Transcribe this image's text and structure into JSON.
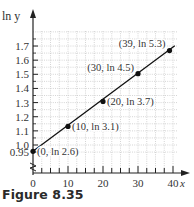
{
  "caption": "Figure 8.35",
  "chart_data": {
    "type": "line",
    "title": "",
    "xlabel": "x",
    "ylabel": "ln y",
    "xlim": [
      0,
      40
    ],
    "ylim": [
      0.95,
      1.8
    ],
    "y_axis_break": true,
    "grid": true,
    "x_ticks": [
      "0",
      "10",
      "20",
      "30",
      "40"
    ],
    "y_ticks": [
      "0.95",
      "1.0",
      "1.1",
      "1.2",
      "1.3",
      "1.4",
      "1.5",
      "1.6",
      "1.7"
    ],
    "series": [
      {
        "name": "ln y vs x",
        "x": [
          0,
          10,
          20,
          30,
          39
        ],
        "y": [
          0.9555,
          1.1314,
          1.3083,
          1.5041,
          1.6677
        ]
      }
    ],
    "annotations": [
      {
        "x": 0,
        "y": 0.9555,
        "label": "(0, ln 2.6)"
      },
      {
        "x": 10,
        "y": 1.1314,
        "label": "(10, ln 3.1)"
      },
      {
        "x": 20,
        "y": 1.3083,
        "label": "(20, ln 3.7)"
      },
      {
        "x": 30,
        "y": 1.5041,
        "label": "(30, ln 4.5)"
      },
      {
        "x": 39,
        "y": 1.6677,
        "label": "(39, ln 5.3)"
      }
    ]
  }
}
